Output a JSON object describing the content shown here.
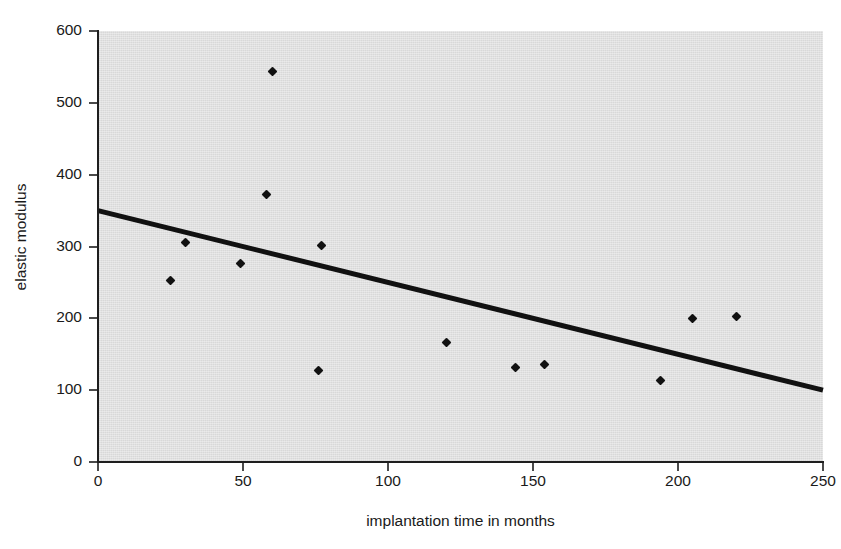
{
  "chart_data": {
    "type": "scatter",
    "title": "",
    "xlabel": "implantation time in months",
    "ylabel": "elastic modulus",
    "xlim": [
      0,
      250
    ],
    "ylim": [
      0,
      600
    ],
    "xticks": [
      "0",
      "50",
      "100",
      "150",
      "200",
      "250"
    ],
    "xtick_values": [
      0,
      50,
      100,
      150,
      200,
      250
    ],
    "yticks": [
      "0",
      "100",
      "200",
      "300",
      "400",
      "500",
      "600"
    ],
    "ytick_values": [
      0,
      100,
      200,
      300,
      400,
      500,
      600
    ],
    "grid": false,
    "legend": "none",
    "plot_background_color": "#d8d8d8",
    "marker_color": "#111111",
    "marker_shape": "diamond",
    "trendline_color": "#111111",
    "points": [
      {
        "x": 25,
        "y": 252
      },
      {
        "x": 30,
        "y": 305
      },
      {
        "x": 49,
        "y": 276
      },
      {
        "x": 58,
        "y": 372
      },
      {
        "x": 60,
        "y": 544
      },
      {
        "x": 76,
        "y": 128
      },
      {
        "x": 77,
        "y": 302
      },
      {
        "x": 120,
        "y": 167
      },
      {
        "x": 144,
        "y": 132
      },
      {
        "x": 154,
        "y": 136
      },
      {
        "x": 194,
        "y": 114
      },
      {
        "x": 205,
        "y": 200
      },
      {
        "x": 220,
        "y": 202
      }
    ],
    "trendline": {
      "name": "linear fit",
      "x": [
        0,
        250
      ],
      "y": [
        350,
        100
      ]
    }
  }
}
